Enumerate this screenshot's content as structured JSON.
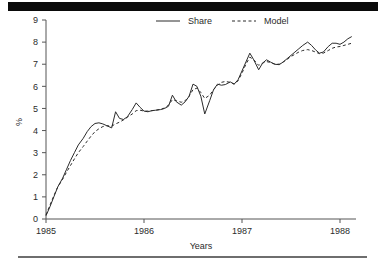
{
  "figure": {
    "background_color": "#ffffff",
    "top_bar_color": "#0a0a0a",
    "bottom_rule_color": "#6e6e6e",
    "axis_color": "#555555",
    "ink_color": "#2b2b2b"
  },
  "chart_data": {
    "type": "line",
    "title": "",
    "xlabel": "Years",
    "ylabel": "%",
    "xlim": [
      1985.0,
      1988.12
    ],
    "ylim": [
      0,
      9
    ],
    "xticks": [
      1985,
      1986,
      1987,
      1988
    ],
    "xticklabels": [
      "1985",
      "1986",
      "1987",
      "1988"
    ],
    "yticks": [
      0,
      1,
      2,
      3,
      4,
      5,
      6,
      7,
      8,
      9
    ],
    "yticklabels": [
      "0",
      "1",
      "2",
      "3",
      "4",
      "5",
      "6",
      "7",
      "8",
      "9"
    ],
    "grid": false,
    "legend_position": "top-center",
    "series": [
      {
        "name": "Share",
        "style": "solid",
        "color": "#2b2b2b",
        "x": [
          1985.0,
          1985.04,
          1985.08,
          1985.12,
          1985.17,
          1985.21,
          1985.25,
          1985.29,
          1985.33,
          1985.38,
          1985.42,
          1985.46,
          1985.5,
          1985.54,
          1985.58,
          1985.62,
          1985.67,
          1985.71,
          1985.75,
          1985.79,
          1985.83,
          1985.88,
          1985.92,
          1985.96,
          1986.0,
          1986.04,
          1986.08,
          1986.12,
          1986.17,
          1986.21,
          1986.25,
          1986.29,
          1986.33,
          1986.38,
          1986.42,
          1986.46,
          1986.5,
          1986.54,
          1986.58,
          1986.62,
          1986.67,
          1986.71,
          1986.75,
          1986.79,
          1986.83,
          1986.88,
          1986.92,
          1986.96,
          1987.0,
          1987.04,
          1987.08,
          1987.12,
          1987.17,
          1987.21,
          1987.25,
          1987.29,
          1987.33,
          1987.38,
          1987.42,
          1987.46,
          1987.5,
          1987.54,
          1987.58,
          1987.62,
          1987.67,
          1987.71,
          1987.75,
          1987.79,
          1987.83,
          1987.88,
          1987.92,
          1987.96,
          1988.0,
          1988.04,
          1988.08,
          1988.12
        ],
        "values": [
          0.15,
          0.55,
          1.0,
          1.45,
          1.85,
          2.25,
          2.65,
          3.0,
          3.35,
          3.65,
          3.95,
          4.18,
          4.32,
          4.35,
          4.3,
          4.22,
          4.12,
          4.85,
          4.55,
          4.5,
          4.62,
          4.95,
          5.25,
          5.05,
          4.88,
          4.85,
          4.9,
          4.92,
          4.95,
          5.0,
          5.1,
          5.6,
          5.3,
          5.15,
          5.3,
          5.55,
          6.1,
          6.0,
          5.55,
          4.75,
          5.35,
          5.85,
          6.1,
          6.05,
          6.08,
          6.2,
          6.1,
          6.3,
          6.7,
          7.1,
          7.5,
          7.2,
          6.75,
          7.05,
          7.2,
          7.1,
          7.0,
          6.98,
          7.1,
          7.25,
          7.4,
          7.55,
          7.7,
          7.85,
          8.0,
          7.85,
          7.65,
          7.5,
          7.55,
          7.8,
          7.95,
          7.95,
          7.9,
          8.0,
          8.15,
          8.25
        ]
      },
      {
        "name": "Model",
        "style": "dashed",
        "color": "#2b2b2b",
        "x": [
          1985.0,
          1985.04,
          1985.08,
          1985.12,
          1985.17,
          1985.21,
          1985.25,
          1985.29,
          1985.33,
          1985.38,
          1985.42,
          1985.46,
          1985.5,
          1985.54,
          1985.58,
          1985.62,
          1985.67,
          1985.71,
          1985.75,
          1985.79,
          1985.83,
          1985.88,
          1985.92,
          1985.96,
          1986.0,
          1986.04,
          1986.08,
          1986.12,
          1986.17,
          1986.21,
          1986.25,
          1986.29,
          1986.33,
          1986.38,
          1986.42,
          1986.46,
          1986.5,
          1986.54,
          1986.58,
          1986.62,
          1986.67,
          1986.71,
          1986.75,
          1986.79,
          1986.83,
          1986.88,
          1986.92,
          1986.96,
          1987.0,
          1987.04,
          1987.08,
          1987.12,
          1987.17,
          1987.21,
          1987.25,
          1987.29,
          1987.33,
          1987.38,
          1987.42,
          1987.46,
          1987.5,
          1987.54,
          1987.58,
          1987.62,
          1987.67,
          1987.71,
          1987.75,
          1987.79,
          1987.83,
          1987.88,
          1987.92,
          1987.96,
          1988.0,
          1988.04,
          1988.08,
          1988.12
        ],
        "values": [
          0.18,
          0.62,
          1.05,
          1.45,
          1.8,
          2.12,
          2.42,
          2.72,
          3.0,
          3.28,
          3.52,
          3.75,
          3.95,
          4.08,
          4.18,
          4.22,
          4.2,
          4.3,
          4.38,
          4.48,
          4.6,
          4.75,
          4.9,
          4.92,
          4.88,
          4.88,
          4.9,
          4.92,
          4.96,
          5.02,
          5.15,
          5.4,
          5.35,
          5.28,
          5.35,
          5.55,
          5.85,
          5.92,
          5.72,
          5.45,
          5.6,
          5.85,
          6.05,
          6.18,
          6.22,
          6.18,
          6.1,
          6.25,
          6.6,
          7.0,
          7.32,
          7.2,
          6.95,
          7.05,
          7.12,
          7.08,
          7.02,
          7.0,
          7.1,
          7.22,
          7.35,
          7.45,
          7.55,
          7.62,
          7.66,
          7.62,
          7.55,
          7.48,
          7.5,
          7.62,
          7.72,
          7.78,
          7.8,
          7.85,
          7.9,
          7.95
        ]
      }
    ]
  },
  "legend": {
    "entries": [
      {
        "label": "Share",
        "style": "solid"
      },
      {
        "label": "Model",
        "style": "dashed"
      }
    ]
  }
}
